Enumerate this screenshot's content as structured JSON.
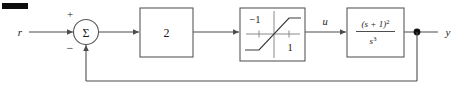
{
  "diagram": {
    "input_label": "r",
    "output_label": "y",
    "intermediate_label": "u",
    "summing_junction": {
      "symbol": "Σ",
      "reference_sign": "+",
      "feedback_sign": "−"
    },
    "gain_block": {
      "label": "2"
    },
    "saturation_block": {
      "lower_limit_label": "−1",
      "upper_limit_label": "1"
    },
    "plant_block": {
      "numerator_base": "(s + 1)",
      "numerator_exponent": "2",
      "denominator_base": "s",
      "denominator_exponent": "3"
    },
    "corner_mark": ""
  },
  "colors": {
    "wire": "#4d4d4d",
    "box_border": "#595959",
    "text": "#1a1a1a",
    "background": "#ffffff",
    "junction_dot": "#111111"
  }
}
